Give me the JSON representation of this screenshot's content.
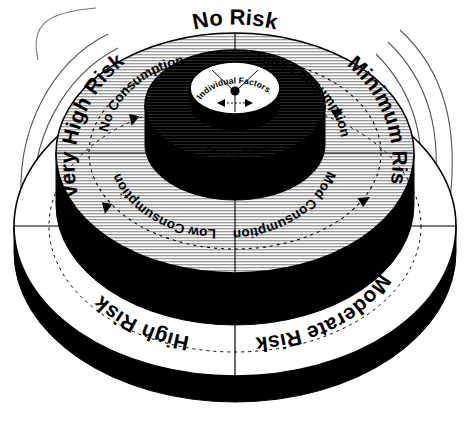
{
  "diagram": {
    "type": "concentric-tiered-cone",
    "colors": {
      "black": "#000000",
      "white": "#ffffff",
      "grey_hatch": "#b4b4b4",
      "dark_hatch": "#1a1a1a",
      "outline": "#000000"
    }
  },
  "core": {
    "label": "Individual Factors",
    "hub_dot": "center-dot",
    "arrows": [
      "arrow-left",
      "arrow-right"
    ]
  },
  "rings": [
    {
      "id": "ring-core",
      "name": "individual-factors-hub",
      "fill": "white",
      "labels": [
        {
          "key": "individual_factors",
          "text": "Individual Factors",
          "position": "center"
        }
      ]
    },
    {
      "id": "ring-dark",
      "name": "drinking-pattern-ring",
      "fill": "dark",
      "labels": [
        {
          "key": "drinking_pattern",
          "text": "Drinking Pattern",
          "position": "center-band"
        }
      ]
    },
    {
      "id": "ring-grey",
      "name": "consumption-ring",
      "fill": "grey",
      "labels": [
        {
          "key": "no_consumption",
          "text": "No Consumption",
          "position": "upper-left"
        },
        {
          "key": "high_consumption",
          "text": "High Consumption",
          "position": "upper-right"
        },
        {
          "key": "low_consumption",
          "text": "Low Consumption",
          "position": "lower-left"
        },
        {
          "key": "mod_consumption",
          "text": "Mod Consumption",
          "position": "lower-right"
        }
      ]
    },
    {
      "id": "ring-outer",
      "name": "risk-level-ring",
      "fill": "white",
      "labels": [
        {
          "key": "no_risk",
          "text": "No Risk",
          "position": "top"
        },
        {
          "key": "minimum_risk",
          "text": "Minimum Risk",
          "position": "right"
        },
        {
          "key": "very_high_risk",
          "text": "Very High Risk",
          "position": "left"
        },
        {
          "key": "moderate_risk",
          "text": "Moderate Risk",
          "position": "bottom-right"
        },
        {
          "key": "high_risk",
          "text": "High Risk",
          "position": "bottom-left"
        }
      ]
    }
  ],
  "labels": {
    "no_risk": "No Risk",
    "minimum_risk": "Minimum Risk",
    "moderate_risk": "Moderate Risk",
    "high_risk": "High Risk",
    "very_high_risk": "Very High Risk",
    "no_consumption": "No Consumption",
    "high_consumption": "High Consumption",
    "mod_consumption": "Mod Consumption",
    "low_consumption": "Low Consumption",
    "drinking_pattern": "Drinking Pattern",
    "individual_factors": "Individual Factors"
  },
  "decoration": {
    "left_arcs": 4,
    "right_arcs": 3,
    "dashed_direction_circles": 2,
    "direction_arrows": [
      "arrow-up-left",
      "arrow-up-right",
      "arrow-outer-left",
      "arrow-outer-right"
    ]
  }
}
